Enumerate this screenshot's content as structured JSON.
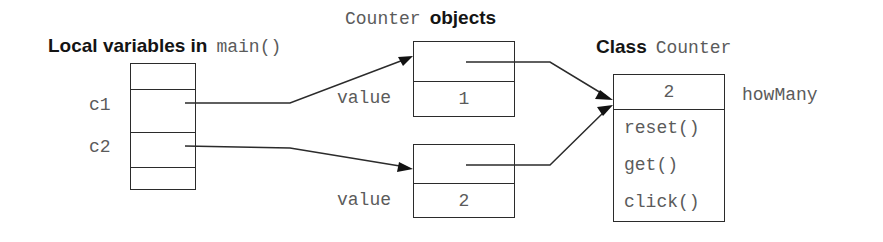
{
  "diagram": {
    "type": "object-reference-diagram",
    "background_color": "#ffffff",
    "line_color": "#2b2b2b",
    "mono_text_color": "#5b5b5b",
    "sans_text_color": "#141414"
  },
  "locals": {
    "title_plain": "Local variables in",
    "title_code": "main()",
    "rows": [
      {
        "name": "",
        "has_pointer": false
      },
      {
        "name": "c1",
        "has_pointer": true
      },
      {
        "name": "c2",
        "has_pointer": true
      },
      {
        "name": "",
        "has_pointer": false
      }
    ]
  },
  "objects": {
    "title_code": "Counter",
    "title_plain": "objects",
    "field_label": "value",
    "instances": [
      {
        "field_label": "value",
        "value": "1"
      },
      {
        "field_label": "value",
        "value": "2"
      }
    ]
  },
  "class_box": {
    "title_plain": "Class",
    "title_code": "Counter",
    "static_field_label": "howMany",
    "static_field_value": "2",
    "methods": [
      "reset()",
      "get()",
      "click()"
    ]
  },
  "arrows": [
    {
      "name": "c1-to-object1",
      "from": "locals.c1",
      "to": "objects.instances.0"
    },
    {
      "name": "c2-to-object2",
      "from": "locals.c2",
      "to": "objects.instances.1"
    },
    {
      "name": "object1-to-class",
      "from": "objects.instances.0",
      "to": "class_box"
    },
    {
      "name": "object2-to-class",
      "from": "objects.instances.1",
      "to": "class_box"
    }
  ]
}
